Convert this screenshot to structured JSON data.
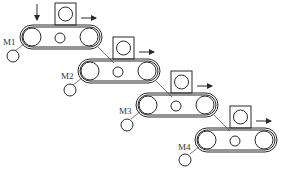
{
  "diagram": {
    "input_arrow": "down-arrow",
    "conveyors": [
      {
        "motor_label": "M1",
        "x": 20,
        "y": 25,
        "direction": "right"
      },
      {
        "motor_label": "M2",
        "x": 78,
        "y": 59,
        "direction": "right"
      },
      {
        "motor_label": "M3",
        "x": 135,
        "y": 93,
        "direction": "right"
      },
      {
        "motor_label": "M4",
        "x": 194,
        "y": 128,
        "direction": "right"
      }
    ],
    "colors": {
      "line": "#2a2a2a",
      "background": "#ffffff"
    }
  }
}
